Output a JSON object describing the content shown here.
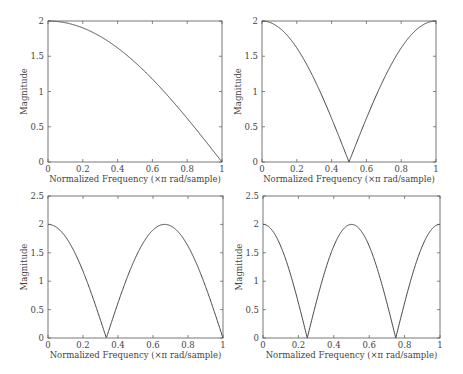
{
  "chart_data": [
    {
      "type": "line",
      "title": "",
      "xlabel": "Normalized Frequency (×π rad/sample)",
      "ylabel": "Magnitude",
      "xlim": [
        0,
        1
      ],
      "ylim": [
        0,
        2
      ],
      "xticks": [
        "0",
        "0.2",
        "0.4",
        "0.6",
        "0.8",
        "1"
      ],
      "yticks": [
        "0",
        "0.5",
        "1",
        "1.5",
        "2"
      ],
      "grid": false,
      "box": {
        "x": 48,
        "y": 21,
        "w": 174,
        "h": 141
      },
      "series": [
        {
          "name": "|H|",
          "formula": "2|cos(1·πf/2)|",
          "k": 1,
          "x": [
            0,
            0.1,
            0.2,
            0.3,
            0.4,
            0.5,
            0.6,
            0.7,
            0.8,
            0.9,
            1.0
          ],
          "values": [
            2.0,
            1.975,
            1.902,
            1.782,
            1.618,
            1.414,
            1.176,
            0.908,
            0.618,
            0.313,
            0.0
          ]
        }
      ]
    },
    {
      "type": "line",
      "title": "",
      "xlabel": "Normalized Frequency (×π rad/sample)",
      "ylabel": "Magnitude",
      "xlim": [
        0,
        1
      ],
      "ylim": [
        0,
        2
      ],
      "xticks": [
        "0",
        "0.2",
        "0.4",
        "0.6",
        "0.8",
        "1"
      ],
      "yticks": [
        "0",
        "0.5",
        "1",
        "1.5",
        "2"
      ],
      "grid": false,
      "box": {
        "x": 262,
        "y": 21,
        "w": 174,
        "h": 141
      },
      "series": [
        {
          "name": "|H|",
          "formula": "2|cos(2·πf/2)|",
          "k": 2,
          "x": [
            0,
            0.1,
            0.2,
            0.3,
            0.4,
            0.5,
            0.6,
            0.7,
            0.8,
            0.9,
            1.0
          ],
          "values": [
            2.0,
            1.902,
            1.618,
            1.176,
            0.618,
            0.0,
            0.618,
            1.176,
            1.618,
            1.902,
            2.0
          ]
        }
      ]
    },
    {
      "type": "line",
      "title": "",
      "xlabel": "Normalized Frequency (×π rad/sample)",
      "ylabel": "Magnitude",
      "xlim": [
        0,
        1
      ],
      "ylim": [
        0,
        2.5
      ],
      "xticks": [
        "0",
        "0.2",
        "0.4",
        "0.6",
        "0.8",
        "1"
      ],
      "yticks": [
        "0",
        "0.5",
        "1",
        "1.5",
        "2",
        "2.5"
      ],
      "grid": false,
      "box": {
        "x": 48,
        "y": 196,
        "w": 175,
        "h": 142
      },
      "series": [
        {
          "name": "|H|",
          "formula": "2|cos(3·πf/2)|",
          "k": 3,
          "x": [
            0,
            0.1,
            0.2,
            0.3,
            0.333,
            0.4,
            0.5,
            0.6,
            0.667,
            0.7,
            0.8,
            0.9,
            1.0
          ],
          "values": [
            2.0,
            1.782,
            1.176,
            0.313,
            0.0,
            0.618,
            1.414,
            1.902,
            2.0,
            1.975,
            1.618,
            0.908,
            0.0
          ]
        }
      ]
    },
    {
      "type": "line",
      "title": "",
      "xlabel": "Normalized Frequency (×π rad/sample)",
      "ylabel": "Magnitude",
      "xlim": [
        0,
        1
      ],
      "ylim": [
        0,
        2.5
      ],
      "xticks": [
        "0",
        "0.2",
        "0.4",
        "0.6",
        "0.8",
        "1"
      ],
      "yticks": [
        "0",
        "0.5",
        "1",
        "1.5",
        "2",
        "2.5"
      ],
      "grid": false,
      "box": {
        "x": 263,
        "y": 196,
        "w": 177,
        "h": 142
      },
      "series": [
        {
          "name": "|H|",
          "formula": "2|cos(4·πf/2)|",
          "k": 4,
          "x": [
            0,
            0.1,
            0.2,
            0.25,
            0.3,
            0.4,
            0.5,
            0.6,
            0.7,
            0.75,
            0.8,
            0.9,
            1.0
          ],
          "values": [
            2.0,
            1.618,
            0.618,
            0.0,
            0.618,
            1.618,
            2.0,
            1.618,
            0.618,
            0.0,
            0.618,
            1.618,
            2.0
          ]
        }
      ]
    }
  ]
}
